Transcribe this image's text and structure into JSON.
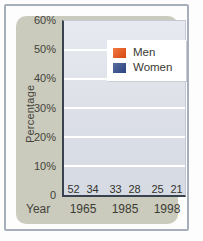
{
  "colors": {
    "frame_border": "#a7afbc",
    "panel_bg": "#cacabd",
    "plot_bg_top": "#e7eaf0",
    "plot_bg_bottom": "#d6dae3",
    "axis_line": "#39424e",
    "gridline": "#ffffff",
    "men_bar_top": "#df4517",
    "men_bar_bottom": "#f8ddc6",
    "women_bar_top": "#2a4381",
    "women_bar_bottom": "#b8bed0",
    "legend_bg": "#ffffff",
    "text": "#3f3f36"
  },
  "chart_data": {
    "type": "bar",
    "title": "",
    "xlabel": "Year",
    "ylabel": "Percentage",
    "categories": [
      "1965",
      "1985",
      "1998"
    ],
    "series": [
      {
        "name": "Men",
        "key": "men",
        "values": [
          52,
          33,
          25
        ]
      },
      {
        "name": "Women",
        "key": "women",
        "values": [
          34,
          28,
          21
        ]
      }
    ],
    "ylim": [
      0,
      60
    ],
    "yticks": [
      {
        "value": 60,
        "label": "60%"
      },
      {
        "value": 50,
        "label": "50%"
      },
      {
        "value": 40,
        "label": "40%"
      },
      {
        "value": 30,
        "label": "30%"
      },
      {
        "value": 20,
        "label": "20%"
      },
      {
        "value": 10,
        "label": "10%"
      },
      {
        "value": 0,
        "label": "0"
      }
    ],
    "gridlines": [
      10,
      20,
      30,
      40,
      50
    ],
    "grid": "horizontal-white",
    "bar_value_labels": true,
    "legend_position": "top-right"
  }
}
